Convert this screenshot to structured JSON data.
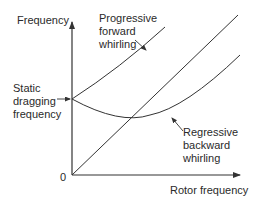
{
  "diagram": {
    "y_axis_label": "Frequency",
    "x_axis_label": "Rotor frequency",
    "origin_label": "0",
    "static_label": [
      "Static",
      "dragging",
      "frequency"
    ],
    "forward_label": [
      "Progressive",
      "forward",
      "whirling"
    ],
    "backward_label": [
      "Regressive",
      "backward",
      "whirling"
    ],
    "line_color": "#333333"
  }
}
